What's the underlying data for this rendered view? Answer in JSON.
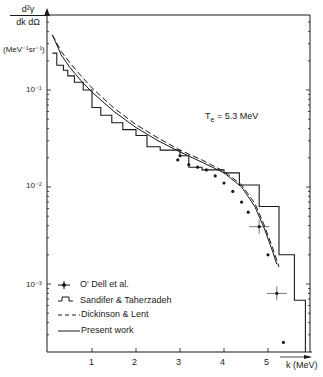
{
  "chart_data": {
    "type": "line",
    "title": "",
    "xlabel": "k (MeV)",
    "ylabel": "d²γ / dk dΩ (MeV⁻¹ sr⁻¹)",
    "ylabel_top": "d²γ",
    "ylabel_bottom": "dk dΩ",
    "yunit": "(MeV⁻¹sr⁻¹)",
    "yscale": "log",
    "xlim": [
      0,
      6.0
    ],
    "ylim": [
      0.0002,
      0.4
    ],
    "xticks": [
      "1",
      "2",
      "3",
      "4",
      "5"
    ],
    "yticks": [
      "10⁻¹",
      "10⁻²",
      "10⁻³"
    ],
    "annotation": "Tₑ = 5.3 MeV",
    "annotation_main": "T",
    "annotation_sub": "e",
    "annotation_value": " = 5.3 MeV",
    "legend_position": "lower-left",
    "series": [
      {
        "name": "O'Dell et al.",
        "style": "points-with-errorbars",
        "x": [
          2.95,
          3.0,
          3.2,
          3.4,
          3.6,
          3.8,
          4.0,
          4.2,
          4.4,
          4.55,
          4.8,
          5.0,
          5.2,
          5.35
        ],
        "values": [
          0.019,
          0.021,
          0.017,
          0.016,
          0.015,
          0.013,
          0.011,
          0.009,
          0.007,
          0.0055,
          0.0039,
          0.002,
          0.0008,
          0.00025
        ]
      },
      {
        "name": "Sandifer & Taherzadeh",
        "style": "histogram",
        "x": [
          0.1,
          0.2,
          0.35,
          0.45,
          0.6,
          0.8,
          1.0,
          1.2,
          1.45,
          1.7,
          2.0,
          2.25,
          2.55,
          3.0,
          3.2,
          3.5,
          4.0,
          4.35,
          4.8,
          5.25,
          5.6
        ],
        "values": [
          0.24,
          0.18,
          0.16,
          0.14,
          0.12,
          0.1,
          0.066,
          0.055,
          0.046,
          0.039,
          0.034,
          0.026,
          0.024,
          0.021,
          0.016,
          0.015,
          0.014,
          0.0105,
          0.0063,
          0.002,
          0.00068
        ]
      },
      {
        "name": "Dickinson & Lent",
        "style": "dashed",
        "x": [
          0.1,
          0.3,
          0.5,
          0.75,
          1.0,
          1.5,
          2.0,
          2.5,
          3.0,
          3.5,
          4.0,
          4.4,
          4.7,
          4.9,
          5.1,
          5.25
        ],
        "values": [
          0.37,
          0.25,
          0.19,
          0.14,
          0.105,
          0.065,
          0.044,
          0.032,
          0.024,
          0.019,
          0.0145,
          0.0105,
          0.0068,
          0.0042,
          0.0024,
          0.0015
        ]
      },
      {
        "name": "Present work",
        "style": "solid",
        "x": [
          0.1,
          0.3,
          0.5,
          0.75,
          1.0,
          1.5,
          2.0,
          2.5,
          3.0,
          3.5,
          4.0,
          4.4,
          4.7,
          4.9,
          5.1,
          5.2
        ],
        "values": [
          0.37,
          0.23,
          0.17,
          0.125,
          0.095,
          0.06,
          0.041,
          0.03,
          0.023,
          0.018,
          0.014,
          0.01,
          0.0063,
          0.0039,
          0.0022,
          0.0016
        ]
      }
    ]
  },
  "legend": {
    "items": [
      {
        "label": "O' Dell  et  al."
      },
      {
        "label": "Sandifer  &   Taherzadeh"
      },
      {
        "label": "Dickinson  &  Lent"
      },
      {
        "label": "Present  work"
      }
    ]
  }
}
